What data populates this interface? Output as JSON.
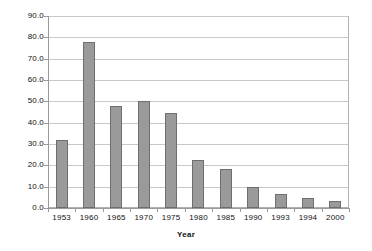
{
  "chart_data": {
    "type": "bar",
    "title": "",
    "xlabel": "Year",
    "ylabel": "",
    "categories": [
      "1953",
      "1960",
      "1965",
      "1970",
      "1975",
      "1980",
      "1985",
      "1990",
      "1993",
      "1994",
      "2000"
    ],
    "values": [
      32.0,
      78.0,
      48.0,
      50.0,
      44.5,
      22.5,
      18.5,
      10.0,
      6.5,
      4.5,
      3.5
    ],
    "ylim": [
      0.0,
      90.0
    ],
    "ytick_labels": [
      "0.0",
      "10.0",
      "20.0",
      "30.0",
      "40.0",
      "50.0",
      "60.0",
      "70.0",
      "80.0",
      "90.0"
    ],
    "ytick_values": [
      0,
      10,
      20,
      30,
      40,
      50,
      60,
      70,
      80,
      90
    ],
    "grid": true,
    "legend": "none",
    "bar_color": "#9a9a9a",
    "bar_border_color": "#6e6e6e",
    "grid_color": "#c8c8c8",
    "axis_color": "#9a9a9a",
    "plot_background": "#ffffff"
  }
}
